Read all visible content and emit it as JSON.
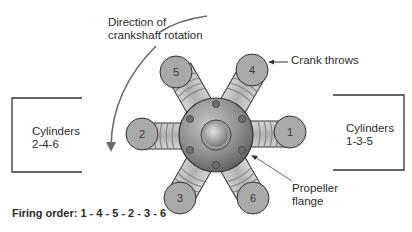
{
  "diagram": {
    "labels": {
      "rotation": [
        "Direction of",
        "crankshaft rotation"
      ],
      "crank_throws": "Crank throws",
      "propeller_flange": [
        "Propeller",
        "flange"
      ],
      "cylinders_left": [
        "Cylinders",
        "2-4-6"
      ],
      "cylinders_right": [
        "Cylinders",
        "1-3-5"
      ],
      "firing_order": "Firing order: 1 - 4 - 5 - 2 - 3 - 6"
    },
    "throws": [
      {
        "number": "1",
        "cx": 290,
        "cy": 132
      },
      {
        "number": "2",
        "cx": 142,
        "cy": 134
      },
      {
        "number": "3",
        "cx": 180,
        "cy": 198
      },
      {
        "number": "4",
        "cx": 252,
        "cy": 70
      },
      {
        "number": "5",
        "cx": 176,
        "cy": 72
      },
      {
        "number": "6",
        "cx": 253,
        "cy": 198
      }
    ],
    "colors": {
      "throw_fill": "#a9a9a9",
      "hub_fill": "#8a8a8a",
      "outline": "#333333",
      "arc": "#666666"
    }
  }
}
